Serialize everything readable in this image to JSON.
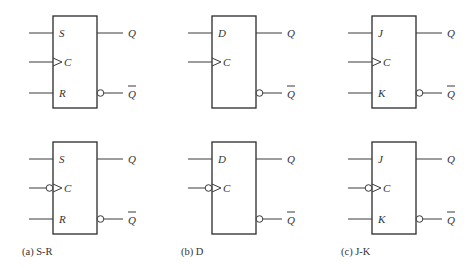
{
  "figure": {
    "columns": [
      {
        "id": "sr",
        "caption": "(a)  S-R",
        "inputs": [
          "S",
          "C",
          "R"
        ],
        "outputs": [
          "Q",
          "Q"
        ],
        "box_x": 53
      },
      {
        "id": "d",
        "caption": "(b)  D",
        "inputs": [
          "D",
          "C"
        ],
        "outputs": [
          "Q",
          "Q"
        ],
        "box_x": 212
      },
      {
        "id": "jk",
        "caption": "(c)  J-K",
        "inputs": [
          "J",
          "C",
          "K"
        ],
        "outputs": [
          "Q",
          "Q"
        ],
        "box_x": 372
      }
    ],
    "rows": [
      {
        "id": "rising-edge",
        "clock_inverted": false
      },
      {
        "id": "falling-edge",
        "clock_inverted": true
      }
    ],
    "colors": {
      "line": "#3a3a3a",
      "text": "#333333",
      "background": "#ffffff"
    }
  }
}
